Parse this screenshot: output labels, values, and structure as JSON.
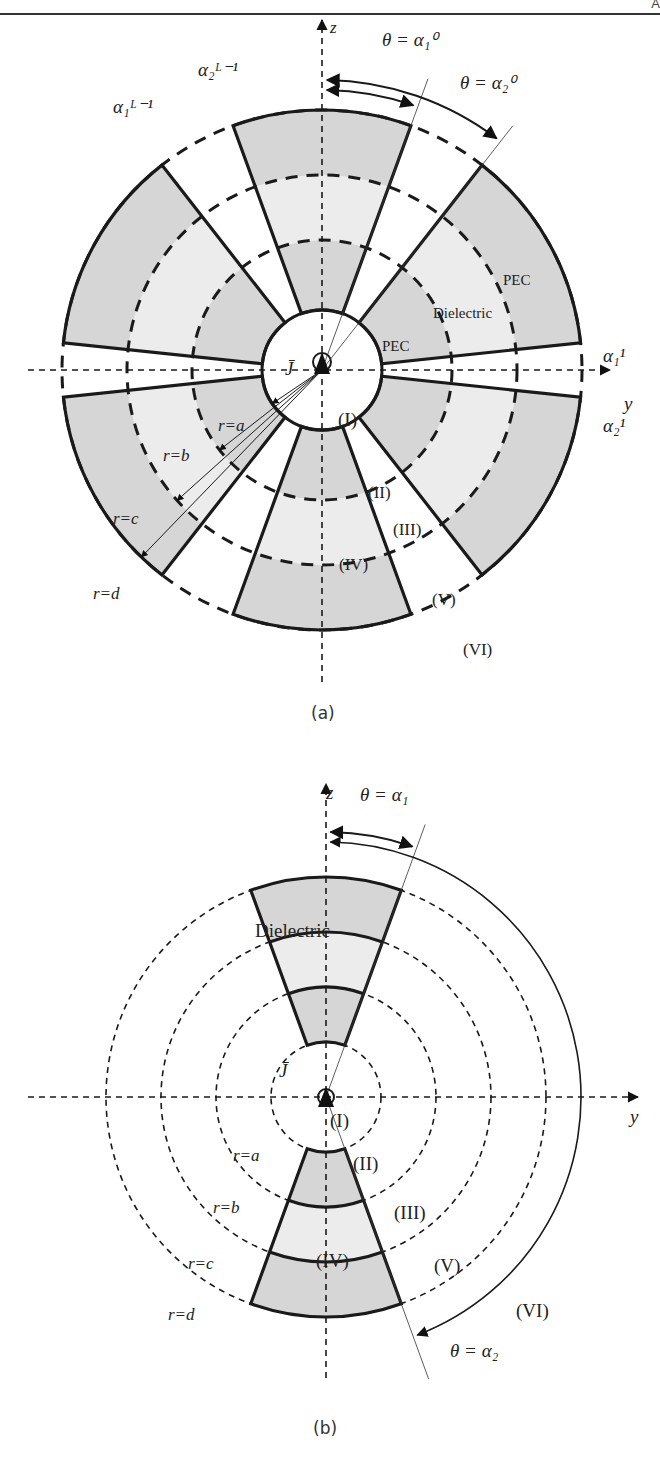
{
  "header": {
    "corner_text": "A"
  },
  "figure_a": {
    "caption": "(a)",
    "axis_z": "z",
    "axis_y": "y",
    "theta_labels": [
      "θ = α₁⁰",
      "θ = α₂⁰"
    ],
    "alpha_labels": {
      "a2_Lm1": "α₂ᴸ⁻¹",
      "a1_Lm1": "α₁ᴸ⁻¹",
      "a1_1": "α₁¹",
      "a2_1": "α₂¹"
    },
    "material_labels": {
      "pec_outer": "PEC",
      "dielectric": "Dielectric",
      "pec_inner": "PEC"
    },
    "source_label": "J̄",
    "radius_labels": [
      "r=a",
      "r=b",
      "r=c",
      "r=d"
    ],
    "regions": [
      "(I)",
      "(II)",
      "(III)",
      "(IV)",
      "(V)",
      "(VI)"
    ]
  },
  "figure_b": {
    "caption": "(b)",
    "axis_z": "z",
    "axis_y": "y",
    "theta_labels": [
      "θ = α₁",
      "θ = α₂"
    ],
    "material_labels": {
      "dielectric": "Dielectric"
    },
    "source_label": "J̄",
    "radius_labels": [
      "r=a",
      "r=b",
      "r=c",
      "r=d"
    ],
    "regions": [
      "(I)",
      "(II)",
      "(III)",
      "(IV)",
      "(V)",
      "(VI)"
    ]
  },
  "colors": {
    "pec_fill": "#d6d6d6",
    "dielectric_fill": "#ececec",
    "line": "#1a1a1a"
  }
}
